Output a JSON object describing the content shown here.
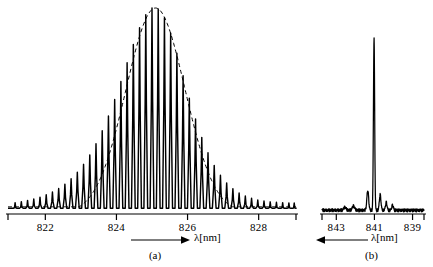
{
  "figure": {
    "background": "#ffffff",
    "ink_color": "#000000"
  },
  "panels": [
    {
      "id": "a",
      "caption": "(a)",
      "axis_label": "λ[nm]",
      "axis_arrow_direction": "right",
      "tick_labels": [
        "822",
        "824",
        "826",
        "828"
      ]
    },
    {
      "id": "b",
      "caption": "(b)",
      "axis_label": "λ[nm]",
      "axis_arrow_direction": "left",
      "tick_labels": [
        "843",
        "841",
        "839"
      ]
    }
  ],
  "chart_data": [
    {
      "type": "line",
      "id": "panel-a-multimode-spectrum",
      "title": "(a)",
      "xlabel": "λ[nm]",
      "ylabel": "",
      "xlim": [
        820.95,
        829.05
      ],
      "ylim": [
        0,
        1.0
      ],
      "grid": false,
      "legend": null,
      "x_ticks": [
        822,
        824,
        826,
        828
      ],
      "x_tick_labels": [
        "822",
        "824",
        "826",
        "828"
      ],
      "axis_direction": "increasing-left-to-right",
      "description": "Multimode laser emission: comb of evenly spaced longitudinal modes under a dashed Gaussian envelope.",
      "envelope": {
        "style": "dashed",
        "type": "gaussian",
        "center_nm": 825.1,
        "peak_value": 1.0,
        "fwhm_nm": 1.95,
        "baseline": 0.035
      },
      "mode_comb": {
        "spacing_nm": 0.175,
        "count": 46,
        "first_mode_nm": 821.15,
        "x": [
          821.15,
          821.325,
          821.5,
          821.675,
          821.85,
          822.025,
          822.2,
          822.375,
          822.55,
          822.725,
          822.9,
          823.075,
          823.25,
          823.425,
          823.6,
          823.775,
          823.95,
          824.125,
          824.3,
          824.475,
          824.65,
          824.825,
          825.0,
          825.175,
          825.35,
          825.525,
          825.7,
          825.875,
          826.05,
          826.225,
          826.4,
          826.575,
          826.75,
          826.925,
          827.1,
          827.275,
          827.45,
          827.625,
          827.8,
          827.975,
          828.15,
          828.325,
          828.5,
          828.675,
          828.85,
          829.0
        ],
        "y": [
          0.055,
          0.06,
          0.066,
          0.073,
          0.082,
          0.093,
          0.107,
          0.124,
          0.145,
          0.171,
          0.203,
          0.241,
          0.287,
          0.341,
          0.404,
          0.476,
          0.556,
          0.643,
          0.734,
          0.823,
          0.904,
          0.967,
          1.0,
          0.995,
          0.953,
          0.878,
          0.78,
          0.671,
          0.562,
          0.461,
          0.372,
          0.297,
          0.236,
          0.188,
          0.151,
          0.123,
          0.102,
          0.087,
          0.076,
          0.068,
          0.063,
          0.059,
          0.057,
          0.055,
          0.054,
          0.053
        ]
      }
    },
    {
      "type": "line",
      "id": "panel-b-single-mode-spectrum",
      "title": "(b)",
      "xlabel": "λ[nm]",
      "ylabel": "",
      "xlim": [
        843.75,
        838.4
      ],
      "ylim": [
        0,
        1.0
      ],
      "grid": false,
      "legend": null,
      "x_ticks": [
        843,
        841,
        839
      ],
      "x_tick_labels": [
        "843",
        "841",
        "839"
      ],
      "axis_direction": "decreasing-left-to-right",
      "description": "Single longitudinal mode emission: one dominant narrow peak at 841 nm with weak side lobes.",
      "peaks": [
        {
          "wavelength_nm": 841.35,
          "height": 0.115,
          "width_nm": 0.11
        },
        {
          "wavelength_nm": 841.02,
          "height": 1.0,
          "width_nm": 0.075
        },
        {
          "wavelength_nm": 840.7,
          "height": 0.09,
          "width_nm": 0.1
        },
        {
          "wavelength_nm": 840.38,
          "height": 0.045,
          "width_nm": 0.1
        },
        {
          "wavelength_nm": 840.05,
          "height": 0.03,
          "width_nm": 0.1
        },
        {
          "wavelength_nm": 842.1,
          "height": 0.025,
          "width_nm": 0.14
        },
        {
          "wavelength_nm": 842.55,
          "height": 0.018,
          "width_nm": 0.14
        }
      ],
      "baseline": 0.022,
      "noise_amplitude": 0.012
    }
  ]
}
